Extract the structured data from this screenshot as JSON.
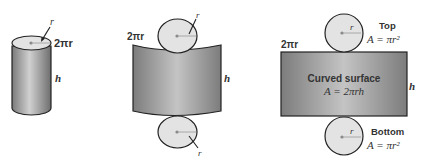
{
  "colors": {
    "surface_dark": "#8a8a8a",
    "surface_light": "#d8d8d8",
    "disk_fill": "#e3e3e3",
    "outline": "#222222",
    "text": "#333333"
  },
  "figure1": {
    "radius_label": "r",
    "circumference_label": "2πr",
    "height_label": "h"
  },
  "figure2": {
    "circumference_label": "2πr",
    "height_label": "h",
    "top_radius_label": "r",
    "bottom_radius_label": "r"
  },
  "figure3": {
    "circumference_label": "2πr",
    "height_label": "h",
    "top_radius_label": "r",
    "bottom_radius_label": "r",
    "top_title": "Top",
    "top_formula": "A = πr²",
    "surface_title": "Curved surface",
    "surface_formula": "A = 2πrh",
    "bottom_title": "Bottom",
    "bottom_formula": "A = πr²"
  }
}
